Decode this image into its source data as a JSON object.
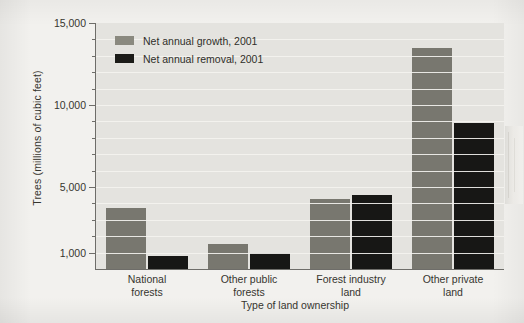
{
  "chart_data": {
    "type": "bar",
    "title": "",
    "xlabel": "Type of land ownership",
    "ylabel": "Trees (millions of cubic feet)",
    "categories": [
      "National forests",
      "Other public forests",
      "Forest industry land",
      "Other private land"
    ],
    "category_lines": [
      [
        "National",
        "forests"
      ],
      [
        "Other public",
        "forests"
      ],
      [
        "Forest industry",
        "land"
      ],
      [
        "Other private",
        "land"
      ]
    ],
    "series": [
      {
        "name": "Net annual growth, 2001",
        "color": "#78776f",
        "values": [
          3700,
          1500,
          4300,
          13500
        ]
      },
      {
        "name": "Net annual removal, 2001",
        "color": "#171715",
        "values": [
          800,
          950,
          4500,
          8900
        ]
      }
    ],
    "ylim": [
      0,
      15000
    ],
    "ytick_labels": [
      "15,000",
      "10,000",
      "5,000",
      "1,000"
    ],
    "ytick_values": [
      15000,
      10000,
      5000,
      1000
    ],
    "yminor_step": 1000,
    "grid": true,
    "legend_position": "top-left"
  },
  "legend": {
    "items": [
      {
        "label": "Net annual growth, 2001",
        "swatch": "growth"
      },
      {
        "label": "Net annual removal, 2001",
        "swatch": "removal"
      }
    ]
  },
  "axis": {
    "y_title": "Trees (millions of cubic feet)",
    "x_title": "Type of land ownership"
  },
  "ticks": {
    "labels": [
      "15,000",
      "10,000",
      "5,000",
      "1,000"
    ]
  }
}
